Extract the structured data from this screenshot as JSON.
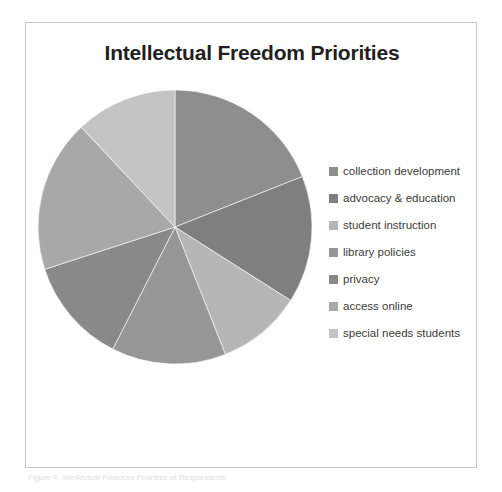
{
  "chart_data": {
    "type": "pie",
    "title": "Intellectual Freedom Priorities",
    "xlabel": "",
    "ylabel": "",
    "legend_position": "right",
    "grid": false,
    "categories": [
      "collection development",
      "advocacy & education",
      "student instruction",
      "library policies",
      "privacy",
      "access online",
      "special needs students"
    ],
    "values": [
      19,
      15,
      10,
      13.5,
      12.5,
      18,
      12
    ],
    "colors": [
      "#8e8e8e",
      "#7f7f7f",
      "#b6b6b6",
      "#969696",
      "#898989",
      "#a8a8a8",
      "#c4c4c4"
    ],
    "start_angle_deg": 0,
    "direction": "clockwise",
    "center": {
      "x": 138,
      "y": 138
    },
    "radius": 137
  },
  "frame": {
    "background": "#ffffff",
    "border_color": "#c9c9c9"
  },
  "title": {
    "text": "Intellectual Freedom Priorities",
    "color": "#231f20"
  },
  "legend": {
    "items": [
      {
        "label": "collection development",
        "color": "#8e8e8e"
      },
      {
        "label": "advocacy & education",
        "color": "#7f7f7f"
      },
      {
        "label": "student instruction",
        "color": "#b6b6b6"
      },
      {
        "label": "library policies",
        "color": "#969696"
      },
      {
        "label": "privacy",
        "color": "#898989"
      },
      {
        "label": "access online",
        "color": "#a8a8a8"
      },
      {
        "label": "special needs students",
        "color": "#c4c4c4"
      }
    ]
  },
  "caption": {
    "text": "Figure 4. Intellectual Freedom Priorities of Respondents"
  }
}
